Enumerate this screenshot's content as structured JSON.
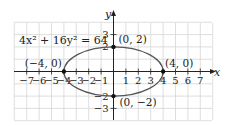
{
  "chart_data": {
    "type": "line",
    "title": "",
    "equation": "4x² + 16y² = 64",
    "xlabel": "x",
    "ylabel": "y",
    "xlim": [
      -8,
      8
    ],
    "ylim": [
      -4,
      4
    ],
    "grid": true,
    "x_ticks": [
      -7,
      -6,
      -5,
      -4,
      -3,
      -2,
      -1,
      1,
      2,
      3,
      4,
      5,
      6,
      7
    ],
    "x_tick_labels": [
      "−7",
      "−6",
      "−5",
      "−4",
      "−3",
      "−2",
      "−1",
      "1",
      "2",
      "3",
      "4",
      "5",
      "6",
      "7"
    ],
    "y_ticks": [
      3,
      2,
      -2,
      -3
    ],
    "y_tick_labels": [
      "3",
      "2",
      "−2",
      "−3"
    ],
    "series": [
      {
        "name": "ellipse",
        "shape": "ellipse",
        "center": [
          0,
          0
        ],
        "semi_major_x": 4,
        "semi_minor_y": 2,
        "color": "#555555"
      }
    ],
    "points": [
      {
        "x": 0,
        "y": 2,
        "label": "(0, 2)"
      },
      {
        "x": 4,
        "y": 0,
        "label": "(4, 0)"
      },
      {
        "x": -4,
        "y": 0,
        "label": "(−4, 0)"
      },
      {
        "x": 0,
        "y": -2,
        "label": "(0, −2)"
      }
    ]
  },
  "colors": {
    "grid": "#d6d6d6",
    "axis": "#222222",
    "curve": "#555555",
    "point": "#111111"
  }
}
